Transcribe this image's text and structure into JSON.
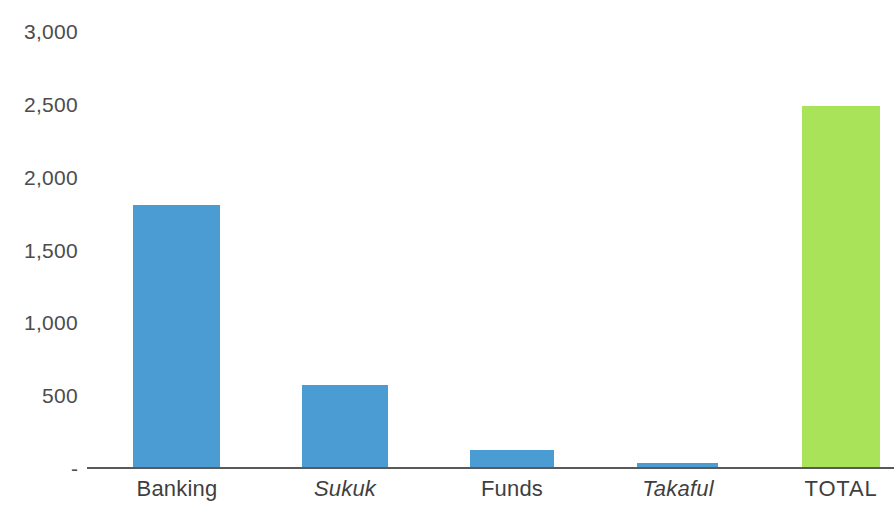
{
  "chart_data": {
    "type": "bar",
    "title": "",
    "subtitle": "",
    "xlabel": "",
    "ylabel": "",
    "categories": [
      "Banking",
      "Sukuk",
      "Funds",
      "Takaful",
      "TOTAL"
    ],
    "values": [
      1800,
      570,
      125,
      35,
      2480
    ],
    "series": [
      {
        "name": "Assets",
        "values": [
          1800,
          570,
          125,
          35,
          2480
        ]
      }
    ],
    "ylim": [
      0,
      3000
    ],
    "y_ticks": [
      0,
      500,
      1000,
      1500,
      2000,
      2500,
      3000
    ],
    "y_tick_labels": [
      "-",
      "500",
      "1,000",
      "1,500",
      "2,000",
      "2,500",
      "3,000"
    ],
    "grid": false,
    "legend": false,
    "legend_position": "none",
    "annotations": []
  },
  "axis": {
    "y_ticks": [
      {
        "label": "3,000",
        "value": 3000
      },
      {
        "label": "2,500",
        "value": 2500
      },
      {
        "label": "2,000",
        "value": 2000
      },
      {
        "label": "1,500",
        "value": 1500
      },
      {
        "label": "1,000",
        "value": 1000
      },
      {
        "label": "500",
        "value": 500
      },
      {
        "label": "-",
        "value": 0
      }
    ]
  },
  "bars": [
    {
      "label": "Banking",
      "value": 1800,
      "color": "#4b9cd3",
      "italic": false,
      "caps": false
    },
    {
      "label": "Sukuk",
      "value": 570,
      "color": "#4b9cd3",
      "italic": true,
      "caps": false
    },
    {
      "label": "Funds",
      "value": 125,
      "color": "#4b9cd3",
      "italic": false,
      "caps": false
    },
    {
      "label": "Takaful",
      "value": 35,
      "color": "#4b9cd3",
      "italic": true,
      "caps": false
    },
    {
      "label": "TOTAL",
      "value": 2480,
      "color": "#a8e35a",
      "italic": false,
      "caps": true
    }
  ],
  "colors": {
    "bar_blue": "#4b9cd3",
    "bar_green": "#a8e35a",
    "axis_line": "#595959",
    "tick_text": "#4c4c4c",
    "category_text": "#3f3f3f",
    "background": "#ffffff"
  }
}
